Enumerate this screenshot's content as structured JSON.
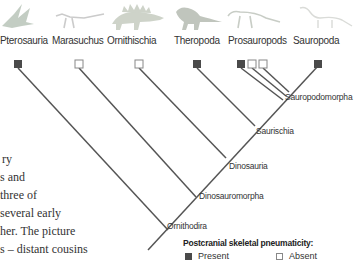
{
  "taxa": [
    {
      "name": "Pterosauria",
      "pneumaticity": "present"
    },
    {
      "name": "Marasuchus",
      "pneumaticity": "absent"
    },
    {
      "name": "Ornithischia",
      "pneumaticity": "absent"
    },
    {
      "name": "Theropoda",
      "pneumaticity": "present"
    },
    {
      "name": "Prosauropods",
      "pneumaticity": [
        "present",
        "absent",
        "absent"
      ]
    },
    {
      "name": "Sauropoda",
      "pneumaticity": "present"
    }
  ],
  "nodes": {
    "sauropodomorpha": "Sauropodomorpha",
    "saurischia": "Saurischia",
    "dinosauria": "Dinosauria",
    "dinosauromorpha": "Dinosauromorpha",
    "ornithodira": "Ornithodira"
  },
  "legend": {
    "title": "Postcranial skeletal pneumaticity:",
    "present": "Present",
    "absent": "Absent"
  },
  "body_text": [
    "ry",
    "s and",
    " three of",
    "several early",
    "her. The picture",
    "s – distant cousins"
  ],
  "colors": {
    "line": "#555555",
    "present": "#4a4a4a",
    "absent_border": "#888888",
    "text": "#333333"
  }
}
